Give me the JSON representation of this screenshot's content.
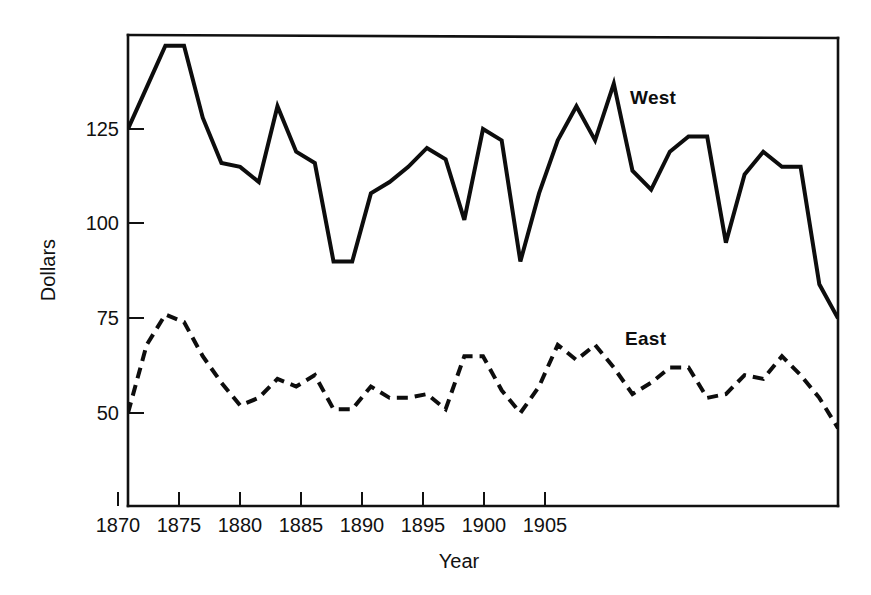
{
  "chart_data": {
    "type": "line",
    "title": "",
    "xlabel": "Year",
    "ylabel": "Dollars",
    "xlim": [
      1870,
      1908
    ],
    "ylim": [
      36,
      147
    ],
    "grid": false,
    "legend_position": "inline-annotation",
    "xticks": [
      1870,
      1875,
      1880,
      1885,
      1890,
      1895,
      1900,
      1905
    ],
    "xtick_labels": [
      "1870",
      "1875",
      "1880",
      "1885",
      "1890",
      "1895",
      "1900",
      "1905"
    ],
    "yticks": [
      50,
      75,
      100,
      125
    ],
    "ytick_labels": [
      "50",
      "75",
      "100",
      "125"
    ],
    "x": [
      1870,
      1871,
      1872,
      1873,
      1874,
      1875,
      1876,
      1877,
      1878,
      1879,
      1880,
      1881,
      1882,
      1883,
      1884,
      1885,
      1886,
      1887,
      1888,
      1889,
      1890,
      1891,
      1892,
      1893,
      1894,
      1895,
      1896,
      1897,
      1898,
      1899,
      1900,
      1901,
      1902,
      1903,
      1904,
      1905,
      1906,
      1907,
      1908
    ],
    "series": [
      {
        "name": "West",
        "style": "solid",
        "values": [
          125,
          136,
          147,
          147,
          128,
          116,
          115,
          111,
          131,
          119,
          116,
          90,
          90,
          108,
          111,
          115,
          120,
          117,
          101,
          125,
          122,
          90,
          108,
          122,
          131,
          122,
          137,
          114,
          109,
          119,
          123,
          123,
          95,
          113,
          119,
          115,
          115,
          84,
          75
        ]
      },
      {
        "name": "East",
        "style": "dashed",
        "values": [
          50,
          68,
          76,
          74,
          65,
          58,
          52,
          54,
          59,
          57,
          60,
          51,
          51,
          57,
          54,
          54,
          55,
          51,
          65,
          65,
          56,
          50,
          57,
          68,
          64,
          68,
          62,
          55,
          58,
          62,
          62,
          54,
          55,
          60,
          59,
          65,
          60,
          54,
          46
        ]
      }
    ],
    "annotations": [
      {
        "text": "West",
        "x": 1897,
        "y": 139
      },
      {
        "text": "East",
        "x": 1896.5,
        "y": 70
      }
    ]
  },
  "axis": {
    "y_title": "Dollars",
    "x_title": "Year"
  }
}
